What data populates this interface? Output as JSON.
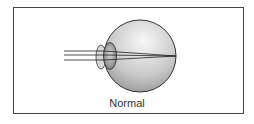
{
  "diagram": {
    "caption": "Normal",
    "colors": {
      "frame": "#444444",
      "eyeball_light": "#f2f2f2",
      "eyeball_dark": "#9a9a9a",
      "lens": "#8c8c8c",
      "rays": "#222222"
    }
  }
}
